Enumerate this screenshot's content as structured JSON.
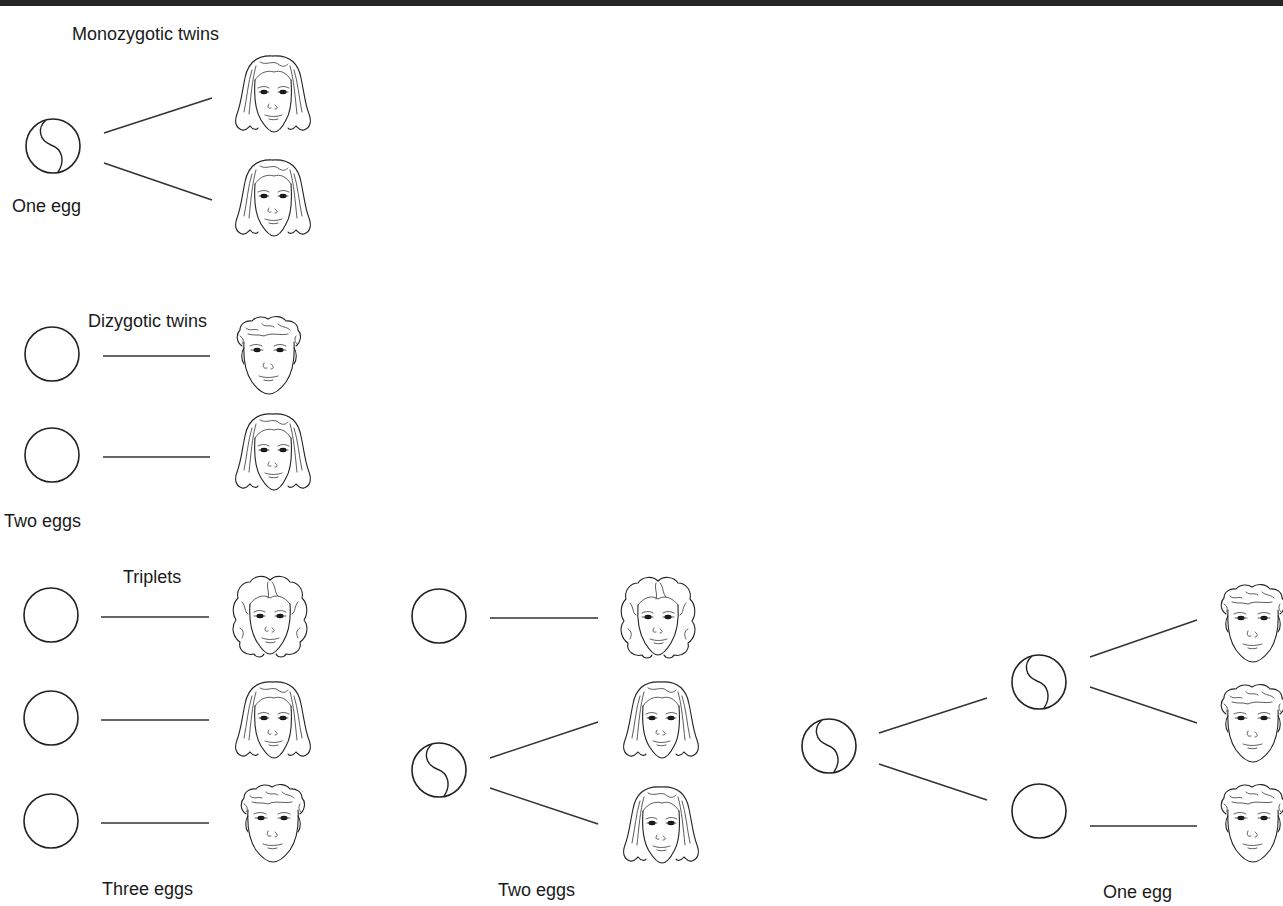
{
  "figure": {
    "topic": "Twins and triplets from eggs",
    "colors": {
      "background": "#ffffff",
      "ink": "#222222",
      "top_bar": "#262626"
    }
  },
  "sections": {
    "monozygotic": {
      "title": "Monozygotic twins",
      "egg_label": "One egg",
      "eggs": [
        {
          "type": "split",
          "cx": 53,
          "cy": 146
        }
      ],
      "connectors": [
        {
          "x1": 104,
          "y1": 133,
          "x2": 212,
          "y2": 98
        },
        {
          "x1": 104,
          "y1": 163,
          "x2": 212,
          "y2": 200
        }
      ],
      "children": [
        {
          "face": "female-long-hair",
          "x": 228,
          "y": 52
        },
        {
          "face": "female-long-hair",
          "x": 228,
          "y": 156
        }
      ]
    },
    "dizygotic": {
      "title": "Dizygotic twins",
      "egg_label": "Two eggs",
      "eggs": [
        {
          "type": "plain",
          "cx": 52,
          "cy": 354
        },
        {
          "type": "plain",
          "cx": 52,
          "cy": 455
        }
      ],
      "connectors": [
        {
          "x1": 103,
          "y1": 356,
          "x2": 210,
          "y2": 356
        },
        {
          "x1": 103,
          "y1": 457,
          "x2": 210,
          "y2": 457
        }
      ],
      "children": [
        {
          "face": "male-curly-hair",
          "x": 228,
          "y": 312
        },
        {
          "face": "female-long-hair",
          "x": 228,
          "y": 410
        }
      ]
    },
    "triplets": {
      "title": "Triplets",
      "groups": [
        {
          "egg_label": "Three eggs",
          "eggs": [
            {
              "type": "plain",
              "cx": 51,
              "cy": 615
            },
            {
              "type": "plain",
              "cx": 51,
              "cy": 718
            },
            {
              "type": "plain",
              "cx": 51,
              "cy": 821
            }
          ],
          "connectors": [
            {
              "x1": 101,
              "y1": 617,
              "x2": 209,
              "y2": 617
            },
            {
              "x1": 101,
              "y1": 720,
              "x2": 209,
              "y2": 720
            },
            {
              "x1": 101,
              "y1": 823,
              "x2": 209,
              "y2": 823
            }
          ],
          "children": [
            {
              "face": "female-curly-hair",
              "x": 224,
              "y": 572
            },
            {
              "face": "female-long-hair",
              "x": 228,
              "y": 678
            },
            {
              "face": "male-curly-hair",
              "x": 232,
              "y": 780
            }
          ]
        },
        {
          "egg_label": "Two eggs",
          "eggs": [
            {
              "type": "plain",
              "cx": 439,
              "cy": 616
            },
            {
              "type": "split",
              "cx": 439,
              "cy": 770
            }
          ],
          "connectors": [
            {
              "x1": 490,
              "y1": 618,
              "x2": 598,
              "y2": 618
            },
            {
              "x1": 490,
              "y1": 758,
              "x2": 598,
              "y2": 722
            },
            {
              "x1": 490,
              "y1": 788,
              "x2": 598,
              "y2": 824
            }
          ],
          "children": [
            {
              "face": "female-curly-hair",
              "x": 612,
              "y": 573
            },
            {
              "face": "female-long-hair",
              "x": 616,
              "y": 678
            },
            {
              "face": "female-long-hair",
              "x": 616,
              "y": 783
            }
          ]
        },
        {
          "egg_label": "One egg",
          "eggs": [
            {
              "type": "split",
              "cx": 829,
              "cy": 746
            },
            {
              "type": "split",
              "cx": 1039,
              "cy": 682
            },
            {
              "type": "plain",
              "cx": 1039,
              "cy": 811
            }
          ],
          "connectors": [
            {
              "x1": 879,
              "y1": 733,
              "x2": 987,
              "y2": 698
            },
            {
              "x1": 879,
              "y1": 764,
              "x2": 987,
              "y2": 800
            },
            {
              "x1": 1090,
              "y1": 657,
              "x2": 1197,
              "y2": 620
            },
            {
              "x1": 1090,
              "y1": 687,
              "x2": 1197,
              "y2": 723
            },
            {
              "x1": 1090,
              "y1": 826,
              "x2": 1197,
              "y2": 826
            }
          ],
          "children": [
            {
              "face": "male-curly-hair",
              "x": 1212,
              "y": 580
            },
            {
              "face": "male-curly-hair",
              "x": 1212,
              "y": 680
            },
            {
              "face": "male-curly-hair",
              "x": 1212,
              "y": 780
            }
          ]
        }
      ]
    }
  },
  "labels": [
    {
      "id": "monozygotic-title",
      "text": "Monozygotic twins",
      "x": 72,
      "y": 23
    },
    {
      "id": "one-egg-mono",
      "text": "One egg",
      "x": 12,
      "y": 195
    },
    {
      "id": "dizygotic-title",
      "text": "Dizygotic twins",
      "x": 88,
      "y": 310
    },
    {
      "id": "two-eggs-di",
      "text": "Two eggs",
      "x": 4,
      "y": 510
    },
    {
      "id": "triplets-title",
      "text": "Triplets",
      "x": 123,
      "y": 566
    },
    {
      "id": "three-eggs",
      "text": "Three eggs",
      "x": 102,
      "y": 878
    },
    {
      "id": "two-eggs-tri",
      "text": "Two eggs",
      "x": 498,
      "y": 879
    },
    {
      "id": "one-egg-tri",
      "text": "One egg",
      "x": 1103,
      "y": 881
    }
  ]
}
